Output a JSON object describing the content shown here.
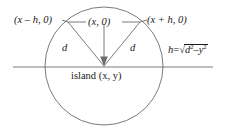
{
  "diagram": {
    "background_color": "#ffffff",
    "stroke_color": "#5a5a5a",
    "text_color": "#1a1a1a",
    "labels": {
      "left_vertex": "(x – h, 0)",
      "center_top": "(x, 0)",
      "right_vertex": "(x + h, 0)",
      "leg_left": "d",
      "leg_right": "d",
      "island": "island (x, y)",
      "formula_lhs": "h",
      "formula_eq": "=",
      "formula_radicand_d": "d",
      "formula_exp_d": "2",
      "formula_minus": "–",
      "formula_radicand_y": "y",
      "formula_exp_y": "2"
    },
    "geometry": {
      "circle_center_x": 104,
      "circle_center_y": 66,
      "circle_radius": 59,
      "axis_line_y": 67,
      "axis_line_x_start": 13,
      "axis_line_x_end": 213,
      "apex_x": 104,
      "apex_y": 66,
      "left_vertex_x": 68,
      "left_vertex_y": 22,
      "right_vertex_x": 140,
      "right_vertex_y": 22
    }
  }
}
